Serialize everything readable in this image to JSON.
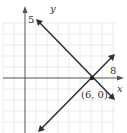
{
  "diagram": {
    "type": "coordinate-graph",
    "axes": {
      "x_label": "x",
      "y_label": "y"
    },
    "tick_labels": {
      "y_tick": "5",
      "x_tick": "8"
    },
    "point": {
      "label": "(6, 0)",
      "x": 6,
      "y": 0
    },
    "lines": [
      {
        "name": "decreasing-line",
        "description": "passes through (1,5) and (6,0)"
      },
      {
        "name": "increasing-line",
        "description": "passes through (6,0), slope 1"
      }
    ],
    "colors": {
      "line": "#333333",
      "grid": "#e3e3e3",
      "axis": "#444444"
    }
  }
}
